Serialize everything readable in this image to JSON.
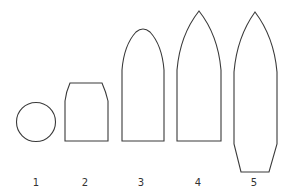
{
  "diagram": {
    "title": "",
    "shapes": [
      {
        "id": 1,
        "label": "1",
        "type": "circle"
      },
      {
        "id": 2,
        "label": "2",
        "type": "blunt-truncated"
      },
      {
        "id": 3,
        "label": "3",
        "type": "rounded-ogive"
      },
      {
        "id": 4,
        "label": "4",
        "type": "pointed-ogive"
      },
      {
        "id": 5,
        "label": "5",
        "type": "pointed-ogive-boat-tail"
      }
    ],
    "colors": {
      "stroke": "#3a3a3a",
      "fill": "#ffffff",
      "background": "#ffffff"
    }
  }
}
